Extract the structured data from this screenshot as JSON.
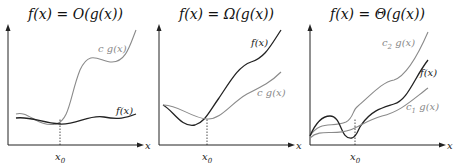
{
  "panels": [
    {
      "title": "f(x) = O(g(x))",
      "x0_label": "x0",
      "x_axis_label": "x",
      "curves": [
        {
          "name": "c g(x)",
          "color": "#8a8a8a",
          "label_pos": [
            98,
            52
          ],
          "path": "M16,114 C28,110 38,128 56,124 C70,120 70,95 80,70 C90,48 100,62 112,62 C126,62 130,45 136,30"
        },
        {
          "name": "f(x)",
          "color": "#222222",
          "label_pos": [
            116,
            114
          ],
          "path": "M16,118 C30,116 42,123 60,124 C76,125 90,114 104,117 C118,120 126,118 136,114"
        }
      ],
      "x0": 60
    },
    {
      "title": "f(x) = Ω(g(x))",
      "x0_label": "x0",
      "x_axis_label": "x",
      "curves": [
        {
          "name": "f(x)",
          "color": "#222222",
          "label_pos": [
            100,
            46
          ],
          "path": "M12,105 C22,110 30,128 44,125 C54,122 58,112 68,98 C80,80 88,66 100,62 C114,58 120,45 130,30"
        },
        {
          "name": "c g(x)",
          "color": "#8a8a8a",
          "label_pos": [
            106,
            96
          ],
          "path": "M12,105 C26,104 40,118 56,119 C70,120 80,103 96,94 C112,86 120,82 130,72"
        }
      ],
      "x0": 56
    },
    {
      "title": "f(x) = Θ(g(x))",
      "x0_label": "x0",
      "x_axis_label": "x",
      "curves": [
        {
          "name": "c2 g(x)",
          "color": "#8a8a8a",
          "label_pos": [
            80,
            46
          ],
          "path": "M8,136 C18,120 30,128 44,122 C52,118 50,110 56,106 C70,94 80,82 92,80 C104,76 116,55 126,32"
        },
        {
          "name": "f(x)",
          "color": "#222222",
          "label_pos": [
            118,
            76
          ],
          "path": "M8,136 C14,122 20,116 28,116 C40,116 38,140 50,138 C56,136 56,128 60,124 C70,110 80,108 92,104 C106,100 112,78 126,60"
        },
        {
          "name": "c1 g(x)",
          "color": "#8a8a8a",
          "label_pos": [
            104,
            110
          ],
          "path": "M8,138 C18,128 32,136 48,130 C58,126 66,120 80,116 C98,112 110,100 126,88"
        }
      ],
      "x0": 53
    }
  ],
  "colors": {
    "axis": "#222222",
    "light_curve": "#8a8a8a",
    "dark_curve": "#222222"
  }
}
